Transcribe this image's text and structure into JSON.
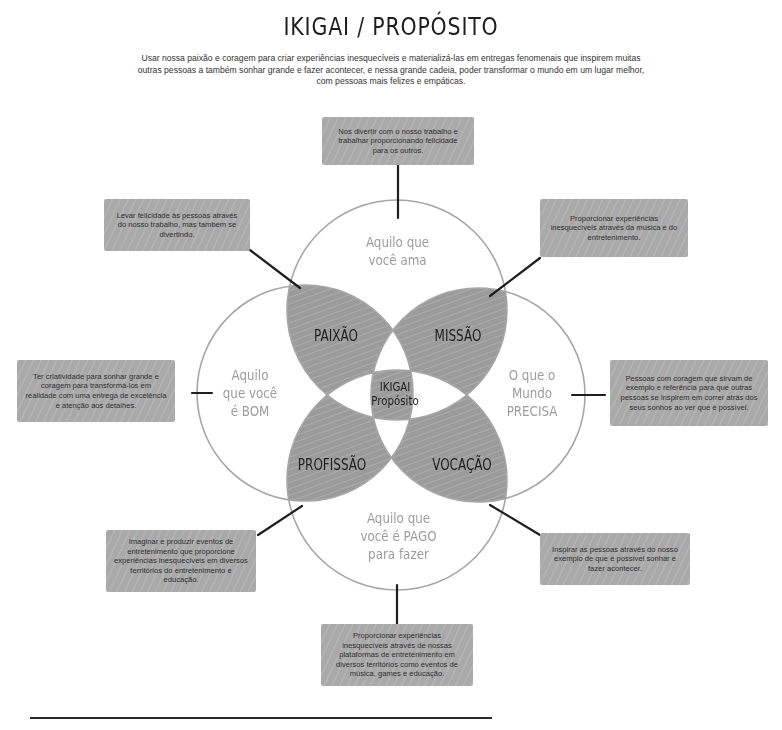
{
  "header": {
    "title": "IKIGAI / PROPÓSITO",
    "subtitle": "Usar nossa paixão e coragem para criar experiências inesquecíveis e materializá-las em entregas fenomenais que inspirem muitas outras pessoas a também sonhar grande e fazer acontecer, e nessa grande cadeia, poder transformar o mundo em um lugar melhor, com pessoas mais felizes e empáticas."
  },
  "circles": {
    "top": "Aquilo que você ama",
    "left": "Aquilo que você é BOM",
    "right": "O que o Mundo PRECISA",
    "bottom": "Aquilo que você é PAGO para fazer"
  },
  "circle_lines": {
    "top": [
      "Aquilo que",
      "você ama"
    ],
    "left": [
      "Aquilo",
      "que você",
      "é BOM"
    ],
    "right": [
      "O que o",
      "Mundo",
      "PRECISA"
    ],
    "bottom": [
      "Aquilo que",
      "você é PAGO",
      "para fazer"
    ]
  },
  "regions": {
    "paixao": "PAIXÃO",
    "missao": "MISSÃO",
    "profissao": "PROFISSÃO",
    "vocacao": "VOCAÇÃO",
    "center_line1": "IKIGAI",
    "center_line2": "Propósito"
  },
  "boxes": {
    "top": "Nos divertir com o nosso trabalho e trabalhar proporcionando felicidade para os outros.",
    "top_left": "Levar felicidade às pessoas através do nosso trabalho, mas também se divertindo.",
    "top_right": "Proporcionar experiências inesquecíveis através da música e do entretenimento.",
    "left": "Ter criatividade para sonhar grande e coragem para transformá-los em realidade com uma entrega de excelência e atenção aos detalhes.",
    "right": "Pessoas com coragem que sirvam de exemplo e referência para que outras pessoas se inspirem em correr atrás dos seus sonhos ao ver que é possível.",
    "bottom_left": "Imaginar e produzir eventos de entretenimento que proporcione experiências inesquecíveis em diversos territórios do entretenimento e educação.",
    "bottom_right": "Inspirar as pessoas através do nosso exemplo de que é possível sonhar e fazer acontecer.",
    "bottom": "Proporcionar experiências inesquecíveis através de nossas plataformas de entretenimento em diversos territórios como eventos de música, games e educação."
  },
  "colors": {
    "box_fill": "#a9a9a9",
    "overlap_fill": "#9b9b9b",
    "circle_stroke": "#a6a6a6",
    "connector": "#1e1e1e",
    "circle_text": "#9c9c9c"
  }
}
